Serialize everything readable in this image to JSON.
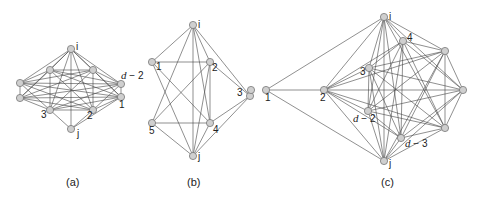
{
  "figure": {
    "panels": [
      {
        "id": "a",
        "caption": "(a)",
        "caption_pos": [
          66,
          186
        ],
        "nodes": [
          {
            "id": "i",
            "x": 71,
            "y": 49,
            "label": "i",
            "lx": 76,
            "ly": 50
          },
          {
            "id": "tl",
            "x": 50,
            "y": 70,
            "label": "",
            "lx": 0,
            "ly": 0
          },
          {
            "id": "tr",
            "x": 93,
            "y": 70,
            "label": "",
            "lx": 0,
            "ly": 0
          },
          {
            "id": "lu",
            "x": 20,
            "y": 83,
            "label": "",
            "lx": 0,
            "ly": 0
          },
          {
            "id": "ld",
            "x": 20,
            "y": 98,
            "label": "",
            "lx": 0,
            "ly": 0
          },
          {
            "id": "d2",
            "x": 121,
            "y": 84,
            "label": "d − 2",
            "lx": 121,
            "ly": 79,
            "italic_prefix": true
          },
          {
            "id": "n1",
            "x": 121,
            "y": 97,
            "label": "1",
            "lx": 119,
            "ly": 108
          },
          {
            "id": "n3",
            "x": 50,
            "y": 110,
            "label": "3",
            "lx": 41,
            "ly": 118
          },
          {
            "id": "n2",
            "x": 93,
            "y": 110,
            "label": "2",
            "lx": 87,
            "ly": 119
          },
          {
            "id": "j",
            "x": 71,
            "y": 129,
            "label": "j",
            "lx": 77,
            "ly": 137
          }
        ],
        "edges_complete_among": [
          "i",
          "tl",
          "tr",
          "lu",
          "ld",
          "d2",
          "n1",
          "n3",
          "n2"
        ],
        "extra_edges": [
          [
            "j",
            "n3"
          ],
          [
            "j",
            "n2"
          ],
          [
            "j",
            "i"
          ],
          [
            "j",
            "n1"
          ]
        ]
      },
      {
        "id": "b",
        "caption": "(b)",
        "caption_pos": [
          187,
          186
        ],
        "nodes": [
          {
            "id": "i",
            "x": 193,
            "y": 25,
            "label": "i",
            "lx": 198,
            "ly": 28
          },
          {
            "id": "n1",
            "x": 152,
            "y": 62,
            "label": "1",
            "lx": 156,
            "ly": 70
          },
          {
            "id": "n2",
            "x": 210,
            "y": 62,
            "label": "2",
            "lx": 212,
            "ly": 71
          },
          {
            "id": "n3",
            "x": 250,
            "y": 96,
            "label": "3",
            "lx": 237,
            "ly": 96
          },
          {
            "id": "n5",
            "x": 152,
            "y": 123,
            "label": "5",
            "lx": 149,
            "ly": 134
          },
          {
            "id": "n4",
            "x": 210,
            "y": 123,
            "label": "4",
            "lx": 213,
            "ly": 133
          },
          {
            "id": "j",
            "x": 193,
            "y": 156,
            "label": "j",
            "lx": 198,
            "ly": 160
          }
        ],
        "edges": [
          [
            "i",
            "n1"
          ],
          [
            "i",
            "n2"
          ],
          [
            "i",
            "n3"
          ],
          [
            "i",
            "n5"
          ],
          [
            "i",
            "n4"
          ],
          [
            "i",
            "j"
          ],
          [
            "n1",
            "n2"
          ],
          [
            "n1",
            "n4"
          ],
          [
            "n1",
            "j"
          ],
          [
            "n2",
            "n3"
          ],
          [
            "n2",
            "n5"
          ],
          [
            "n2",
            "n4"
          ],
          [
            "n2",
            "j"
          ],
          [
            "n5",
            "n4"
          ],
          [
            "n5",
            "j"
          ],
          [
            "n4",
            "n3"
          ],
          [
            "n4",
            "j"
          ],
          [
            "n3",
            "j"
          ]
        ]
      },
      {
        "id": "c",
        "caption": "(c)",
        "caption_pos": [
          381,
          186
        ],
        "nodes": [
          {
            "id": "far",
            "x": 251,
            "y": 90,
            "label": "",
            "lx": 0,
            "ly": 0
          },
          {
            "id": "n1",
            "x": 266,
            "y": 90,
            "label": "1",
            "lx": 265,
            "ly": 101
          },
          {
            "id": "n2",
            "x": 324,
            "y": 90,
            "label": "2",
            "lx": 320,
            "ly": 101
          },
          {
            "id": "i",
            "x": 384,
            "y": 17,
            "label": "i",
            "lx": 389,
            "ly": 20
          },
          {
            "id": "n4",
            "x": 403,
            "y": 41,
            "label": "4",
            "lx": 407,
            "ly": 41
          },
          {
            "id": "rt",
            "x": 445,
            "y": 51,
            "label": "",
            "lx": 0,
            "ly": 0
          },
          {
            "id": "n3",
            "x": 369,
            "y": 68,
            "label": "3",
            "lx": 360,
            "ly": 75
          },
          {
            "id": "fr",
            "x": 463,
            "y": 90,
            "label": "",
            "lx": 0,
            "ly": 0
          },
          {
            "id": "d2",
            "x": 368,
            "y": 111,
            "label": "d − 2",
            "lx": 353,
            "ly": 122
          },
          {
            "id": "rb",
            "x": 445,
            "y": 128,
            "label": "",
            "lx": 0,
            "ly": 0
          },
          {
            "id": "d3",
            "x": 401,
            "y": 138,
            "label": "d − 3",
            "lx": 405,
            "ly": 147
          },
          {
            "id": "j",
            "x": 384,
            "y": 161,
            "label": "j",
            "lx": 389,
            "ly": 167
          }
        ],
        "edges_complete_among": [
          "i",
          "n4",
          "rt",
          "n3",
          "fr",
          "d2",
          "rb",
          "d3",
          "j"
        ],
        "hub_edges_from": {
          "n2": [
            "i",
            "n4",
            "rt",
            "n3",
            "fr",
            "d2",
            "rb",
            "d3",
            "j"
          ]
        },
        "extra_edges": [
          [
            "n1",
            "i"
          ],
          [
            "n1",
            "n2"
          ],
          [
            "n1",
            "j"
          ]
        ]
      }
    ]
  }
}
